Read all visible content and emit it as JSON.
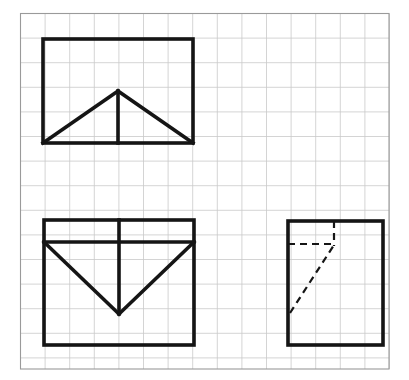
{
  "page": {
    "width": 409,
    "height": 380,
    "background_color": "#ffffff"
  },
  "colors": {
    "grid_line": "#c9c9c9",
    "border_line": "#9a9a9a",
    "object_line": "#151515",
    "hidden_line": "#151515",
    "page_background": "#ffffff"
  },
  "grid": {
    "label": "graph paper grid",
    "spacing_px": 24.6,
    "origin_x": 20.5,
    "origin_y": 13.5,
    "columns": 15,
    "rows": 14,
    "line_width": 0.8,
    "visible": true
  },
  "border": {
    "label": "sheet border",
    "x": 20.5,
    "y": 13.5,
    "width": 368.5,
    "height": 355.5,
    "line_width": 1.1
  },
  "line_weights": {
    "object": 3.6,
    "hidden": 2.2,
    "hidden_dash": "7,5"
  },
  "views": [
    {
      "id": "front-view",
      "name": "front-view",
      "label": "Front view",
      "outline": {
        "x": 43,
        "y": 39,
        "width": 150,
        "height": 104
      },
      "object_lines": [
        {
          "name": "front-roof-left-slope",
          "x1": 43,
          "y1": 143,
          "x2": 118,
          "y2": 91
        },
        {
          "name": "front-roof-right-slope",
          "x1": 118,
          "y1": 91,
          "x2": 193,
          "y2": 143
        },
        {
          "name": "front-center-vertical",
          "x1": 118,
          "y1": 91,
          "x2": 118,
          "y2": 143
        }
      ],
      "hidden_lines": []
    },
    {
      "id": "top-view",
      "name": "top-view",
      "label": "Top view",
      "outline": {
        "x": 44,
        "y": 220,
        "width": 150,
        "height": 125
      },
      "object_lines": [
        {
          "name": "top-horizontal-divider",
          "x1": 44,
          "y1": 242,
          "x2": 194,
          "y2": 242
        },
        {
          "name": "top-center-vertical",
          "x1": 119,
          "y1": 220,
          "x2": 119,
          "y2": 314
        },
        {
          "name": "top-vee-left-slope",
          "x1": 44,
          "y1": 242,
          "x2": 119,
          "y2": 314
        },
        {
          "name": "top-vee-right-slope",
          "x1": 119,
          "y1": 314,
          "x2": 194,
          "y2": 242
        }
      ],
      "hidden_lines": []
    },
    {
      "id": "side-view",
      "name": "side-view",
      "label": "Side view",
      "outline": {
        "x": 288,
        "y": 221,
        "width": 95,
        "height": 124
      },
      "object_lines": [],
      "hidden_lines": [
        {
          "name": "side-hidden-horizontal",
          "x1": 288,
          "y1": 244,
          "x2": 334,
          "y2": 244
        },
        {
          "name": "side-hidden-vertical",
          "x1": 334,
          "y1": 221,
          "x2": 334,
          "y2": 246
        },
        {
          "name": "side-hidden-diagonal",
          "x1": 290,
          "y1": 313,
          "x2": 334,
          "y2": 245
        }
      ]
    }
  ]
}
